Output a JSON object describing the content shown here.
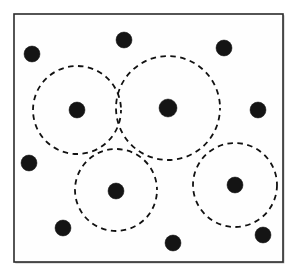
{
  "figure": {
    "width": 297,
    "height": 275,
    "background_color": "#ffffff"
  },
  "frame": {
    "name": "plot-border",
    "x": 14,
    "y": 14,
    "width": 269,
    "height": 248,
    "stroke_color": "#2b2b2b",
    "fill_color": "#fefefe",
    "stroke_width": 1.6
  },
  "chart_data": {
    "type": "scatter",
    "xlabel": "",
    "ylabel": "",
    "xlim": [
      14,
      283
    ],
    "ylim": [
      14,
      262
    ],
    "grid": false,
    "legend": "none",
    "point_color": "#141414",
    "point_radius": 8,
    "circle_color": "#111111",
    "circle_style": "dashed",
    "series": [
      {
        "name": "covered points",
        "note": "points that lie at the centre of a dashed cluster circle",
        "points": [
          {
            "id": "p1",
            "x": 77,
            "y": 110,
            "r": 8
          },
          {
            "id": "p2",
            "x": 168,
            "y": 108,
            "r": 9
          },
          {
            "id": "p3",
            "x": 116,
            "y": 191,
            "r": 8
          },
          {
            "id": "p4",
            "x": 235,
            "y": 185,
            "r": 8
          }
        ]
      },
      {
        "name": "uncovered points",
        "note": "points outside every dashed cluster circle",
        "points": [
          {
            "id": "p5",
            "x": 32,
            "y": 54,
            "r": 8
          },
          {
            "id": "p6",
            "x": 124,
            "y": 40,
            "r": 8
          },
          {
            "id": "p7",
            "x": 224,
            "y": 48,
            "r": 8
          },
          {
            "id": "p8",
            "x": 258,
            "y": 110,
            "r": 8
          },
          {
            "id": "p9",
            "x": 29,
            "y": 163,
            "r": 8
          },
          {
            "id": "p10",
            "x": 63,
            "y": 228,
            "r": 8
          },
          {
            "id": "p11",
            "x": 173,
            "y": 243,
            "r": 8
          },
          {
            "id": "p12",
            "x": 263,
            "y": 235,
            "r": 8
          }
        ]
      }
    ],
    "circles": [
      {
        "id": "c1",
        "label": "cluster 1",
        "cx": 77,
        "cy": 110,
        "r": 44
      },
      {
        "id": "c2",
        "label": "cluster 2",
        "cx": 168,
        "cy": 108,
        "r": 52
      },
      {
        "id": "c3",
        "label": "cluster 3",
        "cx": 116,
        "cy": 190,
        "r": 41
      },
      {
        "id": "c4",
        "label": "cluster 4",
        "cx": 235,
        "cy": 185,
        "r": 42
      }
    ],
    "counts": {
      "total_points": 12,
      "clusters": 4,
      "covered_points": 4,
      "uncovered_points": 8
    }
  }
}
